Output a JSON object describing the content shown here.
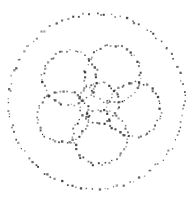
{
  "figure": {
    "title": "",
    "background_color": "#ffffff",
    "dot_color": "#3a3a3a",
    "width": 193,
    "height": 207
  },
  "chart_data": {
    "type": "scatter",
    "title": "",
    "subtitle": "",
    "xlabel": "",
    "ylabel": "",
    "xlim": [
      0,
      193
    ],
    "ylim": [
      0,
      207
    ],
    "grid": false,
    "legend": "none",
    "axes_visible": false,
    "tick_labels_x": [],
    "tick_labels_y": [],
    "annotations": [],
    "marker": {
      "shape": "square",
      "size_px": 1.6,
      "color": "#3a3a3a",
      "opacity_range": [
        0.45,
        1.0
      ]
    },
    "jitter_px": 1.6,
    "series": [
      {
        "name": "outer-circle",
        "shape": "circle",
        "cx": 96.5,
        "cy": 101.5,
        "r": 88.0,
        "n_points": 104
      },
      {
        "name": "petal-circle-top",
        "shape": "circle",
        "cx": 113.0,
        "cy": 74.0,
        "r": 28.0,
        "n_points": 46
      },
      {
        "name": "petal-circle-upper-left",
        "shape": "circle",
        "cx": 70.0,
        "cy": 78.0,
        "r": 27.0,
        "n_points": 45
      },
      {
        "name": "petal-circle-right",
        "shape": "circle",
        "cx": 134.0,
        "cy": 110.0,
        "r": 27.0,
        "n_points": 45
      },
      {
        "name": "petal-circle-left",
        "shape": "circle",
        "cx": 63.0,
        "cy": 117.0,
        "r": 26.0,
        "n_points": 44
      },
      {
        "name": "petal-circle-bottom",
        "shape": "circle",
        "cx": 100.0,
        "cy": 137.0,
        "r": 27.0,
        "n_points": 45
      },
      {
        "name": "center-circle",
        "shape": "circle",
        "cx": 99.0,
        "cy": 103.0,
        "r": 20.0,
        "n_points": 36
      }
    ]
  }
}
